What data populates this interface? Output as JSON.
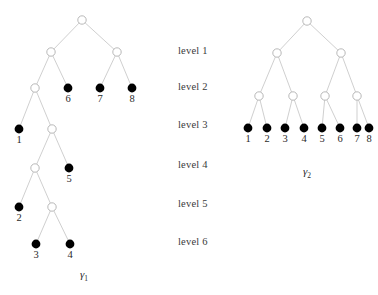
{
  "figure": {
    "background_color": "#ffffff",
    "edge_color": "#c9c9c9",
    "open_node_stroke": "#b0b0b0",
    "open_node_fill": "#ffffff",
    "filled_node_color": "#000000",
    "width": 378,
    "height": 295
  },
  "levels": {
    "label_x": 178,
    "items": [
      {
        "label": "level 1",
        "y": 52
      },
      {
        "label": "level 2",
        "y": 88
      },
      {
        "label": "level 3",
        "y": 126
      },
      {
        "label": "level 4",
        "y": 166
      },
      {
        "label": "level 5",
        "y": 205
      },
      {
        "label": "level 6",
        "y": 243
      }
    ]
  },
  "trees": [
    {
      "id": "gamma-1",
      "caption": "γ",
      "caption_sub": "1",
      "caption_x": 84,
      "caption_y": 268,
      "nodes": [
        {
          "id": "L-root",
          "x": 82,
          "y": 20,
          "type": "open",
          "label": null
        },
        {
          "id": "L-a",
          "x": 51,
          "y": 52,
          "type": "open",
          "label": null
        },
        {
          "id": "L-b",
          "x": 117,
          "y": 52,
          "type": "open",
          "label": null
        },
        {
          "id": "L-c",
          "x": 35,
          "y": 88,
          "type": "open",
          "label": null
        },
        {
          "id": "L-6",
          "x": 68,
          "y": 88,
          "type": "filled",
          "label": "6"
        },
        {
          "id": "L-7",
          "x": 100,
          "y": 88,
          "type": "filled",
          "label": "7"
        },
        {
          "id": "L-8",
          "x": 132,
          "y": 88,
          "type": "filled",
          "label": "8"
        },
        {
          "id": "L-1",
          "x": 19,
          "y": 129,
          "type": "filled",
          "label": "1"
        },
        {
          "id": "L-d",
          "x": 52,
          "y": 129,
          "type": "open",
          "label": null
        },
        {
          "id": "L-e",
          "x": 35,
          "y": 168,
          "type": "open",
          "label": null
        },
        {
          "id": "L-5",
          "x": 69,
          "y": 168,
          "type": "filled",
          "label": "5"
        },
        {
          "id": "L-2",
          "x": 19,
          "y": 207,
          "type": "filled",
          "label": "2"
        },
        {
          "id": "L-f",
          "x": 52,
          "y": 207,
          "type": "open",
          "label": null
        },
        {
          "id": "L-3",
          "x": 36,
          "y": 244,
          "type": "filled",
          "label": "3"
        },
        {
          "id": "L-4",
          "x": 70,
          "y": 244,
          "type": "filled",
          "label": "4"
        }
      ],
      "edges": [
        [
          "L-root",
          "L-a"
        ],
        [
          "L-root",
          "L-b"
        ],
        [
          "L-a",
          "L-c"
        ],
        [
          "L-a",
          "L-6"
        ],
        [
          "L-b",
          "L-7"
        ],
        [
          "L-b",
          "L-8"
        ],
        [
          "L-c",
          "L-1"
        ],
        [
          "L-c",
          "L-d"
        ],
        [
          "L-d",
          "L-e"
        ],
        [
          "L-d",
          "L-5"
        ],
        [
          "L-e",
          "L-2"
        ],
        [
          "L-e",
          "L-f"
        ],
        [
          "L-f",
          "L-3"
        ],
        [
          "L-f",
          "L-4"
        ]
      ]
    },
    {
      "id": "gamma-2",
      "caption": "γ",
      "caption_sub": "2",
      "caption_x": 307,
      "caption_y": 165,
      "nodes": [
        {
          "id": "R-root",
          "x": 307,
          "y": 21,
          "type": "open",
          "label": null
        },
        {
          "id": "R-a",
          "x": 277,
          "y": 53,
          "type": "open",
          "label": null
        },
        {
          "id": "R-b",
          "x": 341,
          "y": 53,
          "type": "open",
          "label": null
        },
        {
          "id": "R-c",
          "x": 259,
          "y": 96,
          "type": "open",
          "label": null
        },
        {
          "id": "R-d",
          "x": 293,
          "y": 96,
          "type": "open",
          "label": null
        },
        {
          "id": "R-e",
          "x": 325,
          "y": 96,
          "type": "open",
          "label": null
        },
        {
          "id": "R-f",
          "x": 357,
          "y": 96,
          "type": "open",
          "label": null
        },
        {
          "id": "R-1",
          "x": 248,
          "y": 128,
          "type": "filled",
          "label": "1"
        },
        {
          "id": "R-2",
          "x": 267,
          "y": 128,
          "type": "filled",
          "label": "2"
        },
        {
          "id": "R-3",
          "x": 285,
          "y": 128,
          "type": "filled",
          "label": "3"
        },
        {
          "id": "R-4",
          "x": 304,
          "y": 128,
          "type": "filled",
          "label": "4"
        },
        {
          "id": "R-5",
          "x": 322,
          "y": 128,
          "type": "filled",
          "label": "5"
        },
        {
          "id": "R-6",
          "x": 340,
          "y": 128,
          "type": "filled",
          "label": "6"
        },
        {
          "id": "R-7",
          "x": 357,
          "y": 128,
          "type": "filled",
          "label": "7"
        },
        {
          "id": "R-8",
          "x": 369,
          "y": 128,
          "type": "filled",
          "label": "8"
        }
      ],
      "edges": [
        [
          "R-root",
          "R-a"
        ],
        [
          "R-root",
          "R-b"
        ],
        [
          "R-a",
          "R-c"
        ],
        [
          "R-a",
          "R-d"
        ],
        [
          "R-b",
          "R-e"
        ],
        [
          "R-b",
          "R-f"
        ],
        [
          "R-c",
          "R-1"
        ],
        [
          "R-c",
          "R-2"
        ],
        [
          "R-d",
          "R-3"
        ],
        [
          "R-d",
          "R-4"
        ],
        [
          "R-e",
          "R-5"
        ],
        [
          "R-e",
          "R-6"
        ],
        [
          "R-f",
          "R-7"
        ],
        [
          "R-f",
          "R-8"
        ]
      ]
    }
  ],
  "geometry": {
    "open_radius": 4.2,
    "filled_radius": 4.4,
    "label_offset_y": 16
  }
}
